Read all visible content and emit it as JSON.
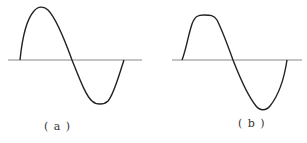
{
  "figures": [
    {
      "id": "a",
      "label": "( a )",
      "description": "sinusoidal waveform",
      "axis": {
        "y": 60,
        "x1": 8,
        "x2": 142
      },
      "colors": {
        "axis": "#888888",
        "wave": "#222222"
      }
    },
    {
      "id": "b",
      "label": "( b )",
      "description": "waveform with flattened positive half-cycle",
      "axis": {
        "y": 60,
        "x1": 172,
        "x2": 302
      },
      "colors": {
        "axis": "#888888",
        "wave": "#222222"
      }
    }
  ]
}
